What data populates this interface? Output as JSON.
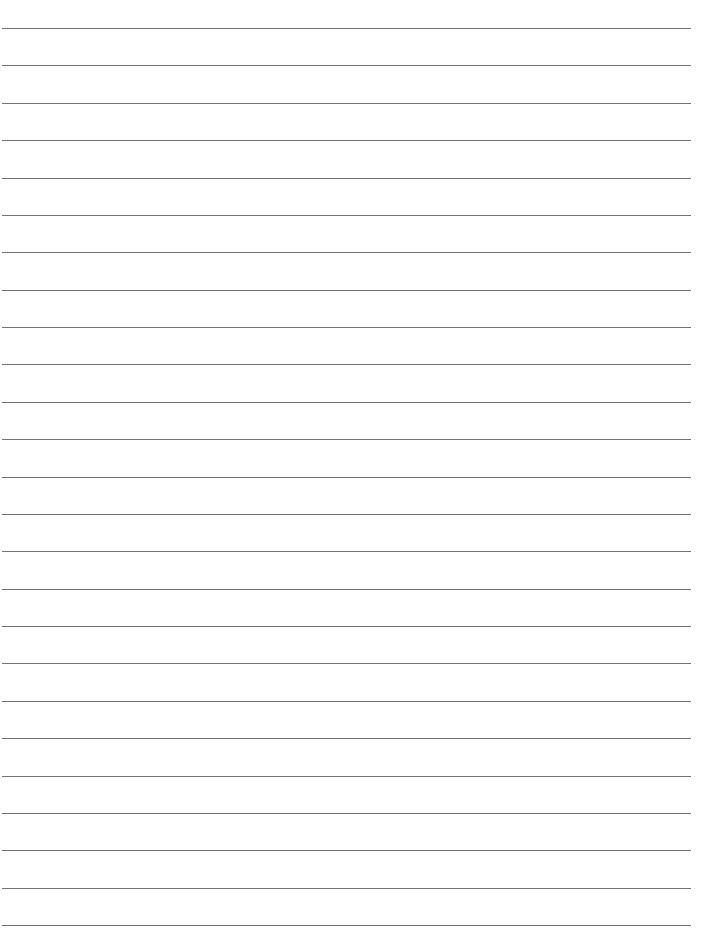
{
  "page": {
    "type": "lined-paper",
    "background_color": "#ffffff",
    "line_color": "#5a5a5a",
    "line_count": 25,
    "first_line_y": 28,
    "line_spacing": 37.375,
    "line_left": 2,
    "line_right": 691,
    "text": ""
  }
}
